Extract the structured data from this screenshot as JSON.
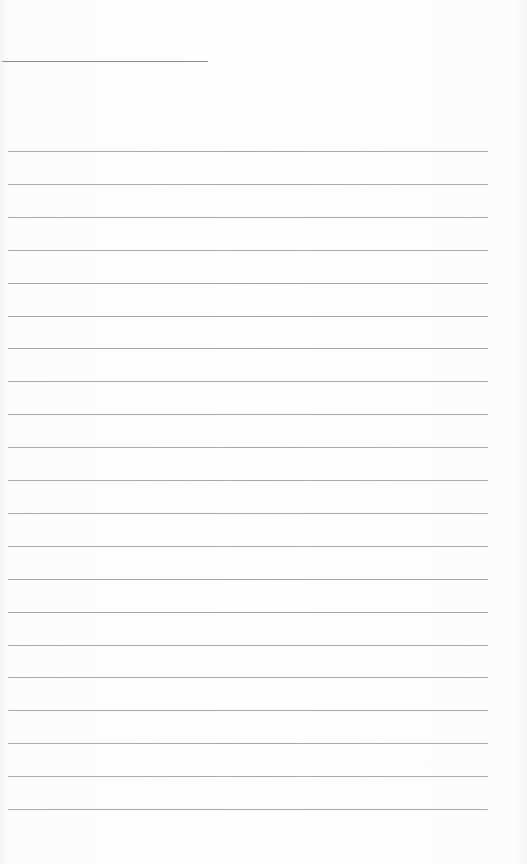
{
  "page": {
    "type": "ruled-notebook-page",
    "header_line": {
      "visible": true
    },
    "rules": {
      "count": 21,
      "first_y": 151,
      "spacing": 32.9,
      "color": "#a9a9a9"
    },
    "text": []
  }
}
